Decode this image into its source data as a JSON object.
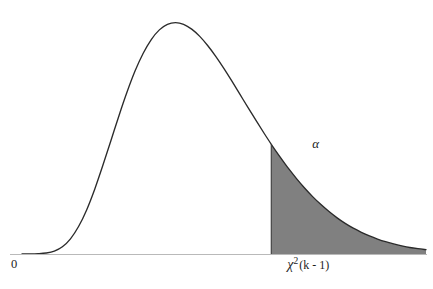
{
  "figure": {
    "title": "",
    "background_color": "#ffffff",
    "width": 433,
    "height": 289
  },
  "labels": {
    "origin": "0",
    "alpha": "α",
    "critical_chi": "χ",
    "critical_superscript": "2",
    "critical_df": "(k - 1)",
    "critical_full": "χ²(k - 1)"
  },
  "colors": {
    "curve": "#2b2b2b",
    "axis": "#b9b9b9",
    "tail_fill": "#808080",
    "text": "#1c1c1c",
    "background": "#ffffff"
  },
  "chart_data": {
    "type": "line",
    "title": "",
    "subtitle": "",
    "xlabel": "",
    "ylabel": "",
    "grid": false,
    "legend": "none",
    "distribution": "chi-squared",
    "xlim": [
      0,
      1
    ],
    "ylim": [
      0,
      1
    ],
    "axis_tick_labels": {
      "x": [
        "0",
        "χ²(k - 1)"
      ],
      "y": []
    },
    "annotations": [
      {
        "text": "α",
        "x": 0.637,
        "y": 0.23,
        "note": "area of shaded right tail"
      },
      {
        "text": "χ²(k - 1)",
        "x": 0.617,
        "y": -0.04,
        "note": "critical value on x axis"
      },
      {
        "text": "0",
        "x": 0.0,
        "y": -0.04,
        "note": "origin of x axis"
      }
    ],
    "critical_value_x": 0.617,
    "peak_x": 0.34,
    "peak_y": 1.0,
    "shaded_region": {
      "from_x": 0.617,
      "to_x": 1.0,
      "label": "α",
      "fill": "#808080"
    },
    "x": [
      0.0,
      0.02,
      0.04,
      0.06,
      0.08,
      0.1,
      0.12,
      0.14,
      0.16,
      0.18,
      0.2,
      0.22,
      0.24,
      0.26,
      0.28,
      0.3,
      0.32,
      0.34,
      0.36,
      0.38,
      0.4,
      0.42,
      0.44,
      0.46,
      0.48,
      0.5,
      0.52,
      0.54,
      0.56,
      0.58,
      0.6,
      0.62,
      0.64,
      0.66,
      0.68,
      0.7,
      0.72,
      0.74,
      0.76,
      0.78,
      0.8,
      0.82,
      0.84,
      0.86,
      0.88,
      0.9,
      0.92,
      0.94,
      0.96,
      0.98,
      1.0
    ],
    "y": [
      0.0,
      0.0,
      0.001,
      0.004,
      0.012,
      0.03,
      0.063,
      0.114,
      0.183,
      0.269,
      0.367,
      0.47,
      0.574,
      0.672,
      0.76,
      0.833,
      0.89,
      0.93,
      0.953,
      0.96,
      0.953,
      0.933,
      0.903,
      0.864,
      0.819,
      0.769,
      0.716,
      0.661,
      0.606,
      0.552,
      0.499,
      0.448,
      0.4,
      0.354,
      0.312,
      0.273,
      0.237,
      0.205,
      0.176,
      0.15,
      0.127,
      0.107,
      0.09,
      0.075,
      0.062,
      0.051,
      0.042,
      0.034,
      0.027,
      0.022,
      0.018
    ]
  }
}
